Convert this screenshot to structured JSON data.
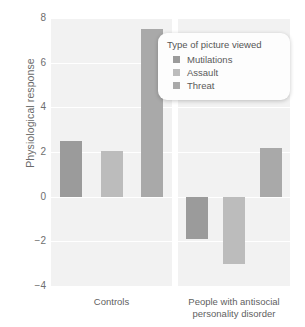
{
  "chart_data": {
    "type": "bar",
    "title": "",
    "xlabel": "",
    "ylabel": "Physiological response",
    "ylim": [
      -4,
      8
    ],
    "yticks": [
      8,
      6,
      4,
      2,
      0,
      -2,
      -4
    ],
    "ytick_labels": [
      "8",
      "6",
      "4",
      "2",
      "0",
      "−2",
      "−4"
    ],
    "grid": true,
    "categories": [
      "Controls",
      "People with antisocial personality disorder"
    ],
    "category_lines": [
      [
        "Controls"
      ],
      [
        "People with antisocial",
        "personality disorder"
      ]
    ],
    "legend": {
      "title": "Type of picture viewed",
      "position": "top-right-inside",
      "entries": [
        {
          "name": "Mutilations",
          "color": "#9b9b9b"
        },
        {
          "name": "Assault",
          "color": "#bcbcbc"
        },
        {
          "name": "Threat",
          "color": "#a9a9a9"
        }
      ]
    },
    "series": [
      {
        "name": "Mutilations",
        "color": "#9b9b9b",
        "values": [
          2.5,
          -1.9
        ]
      },
      {
        "name": "Assault",
        "color": "#bcbcbc",
        "values": [
          2.05,
          -3.0
        ]
      },
      {
        "name": "Threat",
        "color": "#a9a9a9",
        "values": [
          7.5,
          2.2
        ]
      }
    ],
    "colors": {
      "plot_background": "#f2f2f2",
      "gridline": "#ffffff",
      "axis_text": "#6e6e6e",
      "label_text": "#5f5f5f"
    }
  }
}
